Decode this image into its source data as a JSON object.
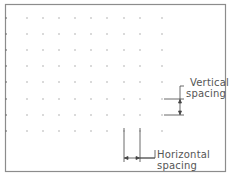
{
  "diagram": {
    "labels": {
      "vertical_line1": "Vertical",
      "vertical_line2": "spacing",
      "horizontal_line1": "Horizontal",
      "horizontal_line2": "spacing"
    },
    "grid": {
      "columns": 9,
      "rows": 8,
      "dot_color": "#9a9a9a"
    },
    "frame_color": "#8c8c8c"
  }
}
